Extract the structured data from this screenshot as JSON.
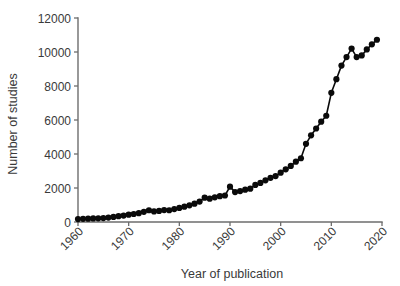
{
  "chart_data": {
    "type": "line",
    "title": "",
    "subtitle": "",
    "xlabel": "Year of publication",
    "ylabel": "Number of studies",
    "xlim": [
      1960,
      2020
    ],
    "ylim": [
      0,
      12000
    ],
    "grid": false,
    "legend": null,
    "marker": "filled-circle",
    "line_color": "#0a0a0a",
    "axis_color": "#6d6d6d",
    "xticks": [
      1960,
      1970,
      1980,
      1990,
      2000,
      2010,
      2020
    ],
    "xtick_labels": [
      "1960",
      "1970",
      "1980",
      "1990",
      "2000",
      "2010",
      "2020"
    ],
    "yticks": [
      0,
      2000,
      4000,
      6000,
      8000,
      10000,
      12000
    ],
    "ytick_labels": [
      "0",
      "2000",
      "4000",
      "6000",
      "8000",
      "10000",
      "12000"
    ],
    "series": [
      {
        "name": "Number of studies",
        "x": [
          1960,
          1961,
          1962,
          1963,
          1964,
          1965,
          1966,
          1967,
          1968,
          1969,
          1970,
          1971,
          1972,
          1973,
          1974,
          1975,
          1976,
          1977,
          1978,
          1979,
          1980,
          1981,
          1982,
          1983,
          1984,
          1985,
          1986,
          1987,
          1988,
          1989,
          1990,
          1991,
          1992,
          1993,
          1994,
          1995,
          1996,
          1997,
          1998,
          1999,
          2000,
          2001,
          2002,
          2003,
          2004,
          2005,
          2006,
          2007,
          2008,
          2009,
          2010,
          2011,
          2012,
          2013,
          2014,
          2015,
          2016,
          2017,
          2018,
          2019
        ],
        "values": [
          170,
          185,
          195,
          210,
          215,
          230,
          260,
          300,
          340,
          380,
          430,
          470,
          520,
          600,
          690,
          620,
          650,
          700,
          690,
          760,
          830,
          900,
          980,
          1080,
          1200,
          1430,
          1370,
          1450,
          1520,
          1560,
          2080,
          1760,
          1820,
          1900,
          1960,
          2180,
          2300,
          2450,
          2600,
          2700,
          2900,
          3100,
          3300,
          3550,
          3750,
          4600,
          5100,
          5500,
          5900,
          6250,
          7600,
          8400,
          9200,
          9700,
          10200,
          9700,
          9800,
          10150,
          10450,
          10720
        ]
      }
    ]
  },
  "axes": {
    "ylabel_text": "Number of studies",
    "xlabel_text": "Year of publication"
  }
}
